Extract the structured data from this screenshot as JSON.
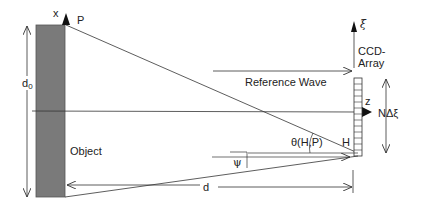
{
  "diagram": {
    "type": "holography-geometry",
    "labels": {
      "x_axis": "x",
      "point_p": "P",
      "object_height": "d",
      "object_height_sub": "0",
      "object": "Object",
      "reference_wave": "Reference Wave",
      "ccd_line1": "CCD-",
      "ccd_line2": "Array",
      "xi_axis": "ξ",
      "z_axis": "z",
      "n_delta_xi": "NΔξ",
      "angle_theta": "θ(H,P)",
      "point_h": "H",
      "angle_psi": "ψ",
      "distance": "d"
    },
    "colors": {
      "object_fill": "#7a7a7a",
      "line": "#333333",
      "text": "#222222"
    },
    "ccd_pixel_count": 13
  }
}
